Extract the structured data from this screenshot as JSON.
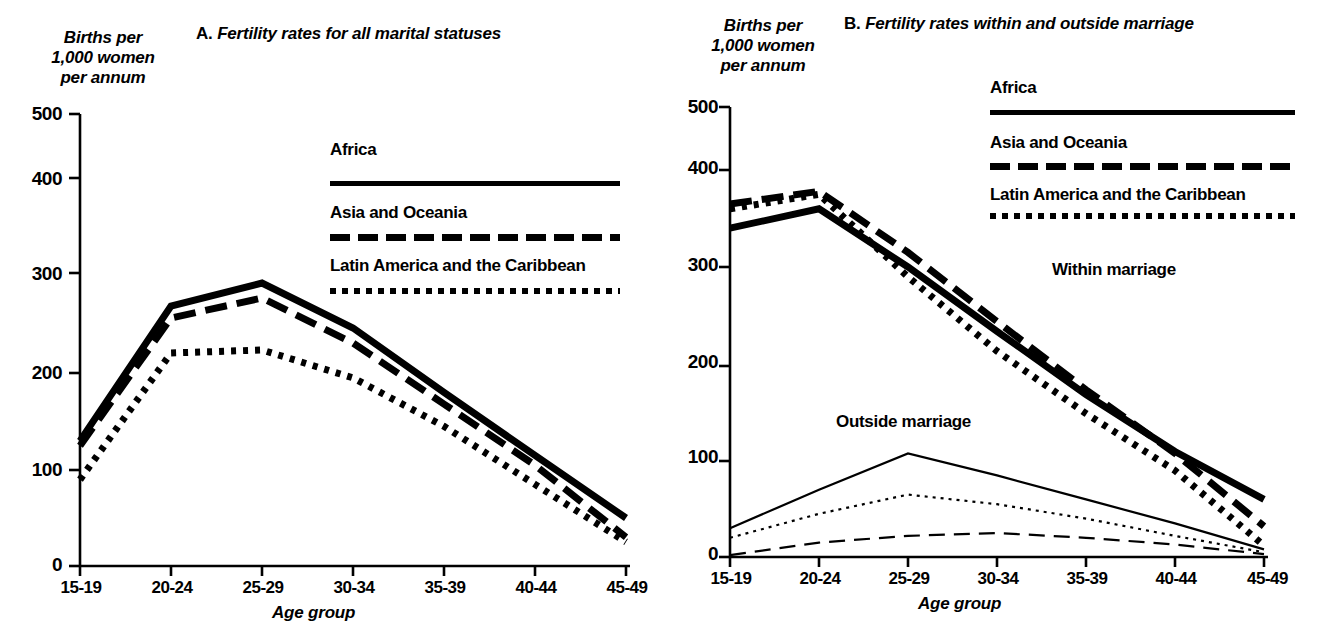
{
  "figure": {
    "panels": [
      {
        "id": "A",
        "lead": "A.",
        "title": "Fertility rates for all marital statuses",
        "y_axis_caption": "Births per\n1,000 women\nper annum",
        "x_axis_title": "Age group",
        "y_ticks": [
          "500",
          "400",
          "300",
          "200",
          "100",
          "0"
        ],
        "x_ticks": [
          "15-19",
          "20-24",
          "25-29",
          "30-34",
          "35-39",
          "40-44",
          "45-49"
        ],
        "legend": [
          {
            "label": "Africa",
            "style": "solid"
          },
          {
            "label": "Asia and Oceania",
            "style": "dashed"
          },
          {
            "label": "Latin America and the Caribbean",
            "style": "dotted"
          }
        ],
        "group_labels": []
      },
      {
        "id": "B",
        "lead": "B.",
        "title": "Fertility rates within and outside marriage",
        "y_axis_caption": "Births per\n1,000 women\nper annum",
        "x_axis_title": "Age group",
        "y_ticks": [
          "500",
          "400",
          "300",
          "200",
          "100",
          "0"
        ],
        "x_ticks": [
          "15-19",
          "20-24",
          "25-29",
          "30-34",
          "35-39",
          "40-44",
          "45-49"
        ],
        "legend": [
          {
            "label": "Africa",
            "style": "solid"
          },
          {
            "label": "Asia and Oceania",
            "style": "dashed"
          },
          {
            "label": "Latin America and the Caribbean",
            "style": "dotted"
          }
        ],
        "group_labels": [
          {
            "label": "Within marriage"
          },
          {
            "label": "Outside marriage"
          }
        ]
      }
    ],
    "colors": {
      "ink": "#000000",
      "background": "#ffffff"
    }
  },
  "chart_data": [
    {
      "type": "line",
      "panel": "A",
      "title": "A.  Fertility rates for all marital statuses",
      "xlabel": "Age group",
      "ylabel": "Births per 1,000 women per annum",
      "categories": [
        "15-19",
        "20-24",
        "25-29",
        "30-34",
        "35-39",
        "40-44",
        "45-49"
      ],
      "ylim": [
        0,
        500
      ],
      "yticks": [
        0,
        100,
        200,
        300,
        400,
        500
      ],
      "grid": false,
      "legend_position": "upper-right",
      "series": [
        {
          "name": "Africa",
          "style": "solid",
          "width": "thick",
          "values": [
            130,
            267,
            290,
            245,
            180,
            115,
            50
          ]
        },
        {
          "name": "Asia and Oceania",
          "style": "dashed",
          "width": "thick",
          "values": [
            125,
            255,
            275,
            230,
            168,
            105,
            30
          ]
        },
        {
          "name": "Latin America and the Caribbean",
          "style": "dotted",
          "width": "thick",
          "values": [
            90,
            220,
            223,
            195,
            145,
            85,
            25
          ]
        }
      ]
    },
    {
      "type": "line",
      "panel": "B",
      "title": "B.  Fertility rates within and outside marriage",
      "xlabel": "Age group",
      "ylabel": "Births per 1,000 women per annum",
      "categories": [
        "15-19",
        "20-24",
        "25-29",
        "30-34",
        "35-39",
        "40-44",
        "45-49"
      ],
      "ylim": [
        0,
        500
      ],
      "yticks": [
        0,
        100,
        200,
        300,
        400,
        500
      ],
      "grid": false,
      "legend_position": "upper-right",
      "annotations": [
        "Within marriage",
        "Outside marriage"
      ],
      "series": [
        {
          "name": "Africa",
          "group": "Within marriage",
          "style": "solid",
          "width": "thick",
          "values": [
            340,
            360,
            300,
            235,
            170,
            110,
            60
          ]
        },
        {
          "name": "Asia and Oceania",
          "group": "Within marriage",
          "style": "dashed",
          "width": "thick",
          "values": [
            365,
            378,
            315,
            245,
            175,
            108,
            32
          ]
        },
        {
          "name": "Latin America and the Caribbean",
          "group": "Within marriage",
          "style": "dotted",
          "width": "thick",
          "values": [
            360,
            375,
            290,
            215,
            150,
            90,
            12
          ]
        },
        {
          "name": "Africa",
          "group": "Outside marriage",
          "style": "solid",
          "width": "thin",
          "values": [
            30,
            70,
            108,
            85,
            60,
            35,
            8
          ]
        },
        {
          "name": "Asia and Oceania",
          "group": "Outside marriage",
          "style": "dashed",
          "width": "thin",
          "values": [
            2,
            15,
            22,
            25,
            20,
            13,
            3
          ]
        },
        {
          "name": "Latin America and the Caribbean",
          "group": "Outside marriage",
          "style": "dotted",
          "width": "thin",
          "values": [
            20,
            45,
            65,
            55,
            40,
            22,
            5
          ]
        }
      ]
    }
  ]
}
